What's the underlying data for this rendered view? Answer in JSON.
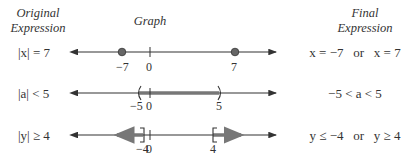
{
  "headers": {
    "original": "Original Expression",
    "original_line1": "Original",
    "original_line2": "Expression",
    "graph": "Graph",
    "final_line1": "Final",
    "final_line2": "Expression"
  },
  "rows": [
    {
      "original": "|x| = 7",
      "graph_type": "points",
      "points": [
        -7,
        7
      ],
      "tick_labels": [
        "−7",
        "0",
        "7"
      ],
      "final": "x = −7   or   x = 7"
    },
    {
      "original": "|a| < 5",
      "graph_type": "open-interval",
      "interval": [
        -5,
        5
      ],
      "tick_labels": [
        "−5",
        "0",
        "5"
      ],
      "final": "−5 < a < 5"
    },
    {
      "original": "|y| ≥ 4",
      "graph_type": "two-rays-closed",
      "rays": [
        "≤ −4",
        "≥ 4"
      ],
      "tick_labels": [
        "−4",
        "0",
        "4"
      ],
      "final": "y ≤ −4   or   y ≥ 4"
    }
  ],
  "colors": {
    "axis": "#333333",
    "highlight": "#777777",
    "text": "#333333"
  }
}
